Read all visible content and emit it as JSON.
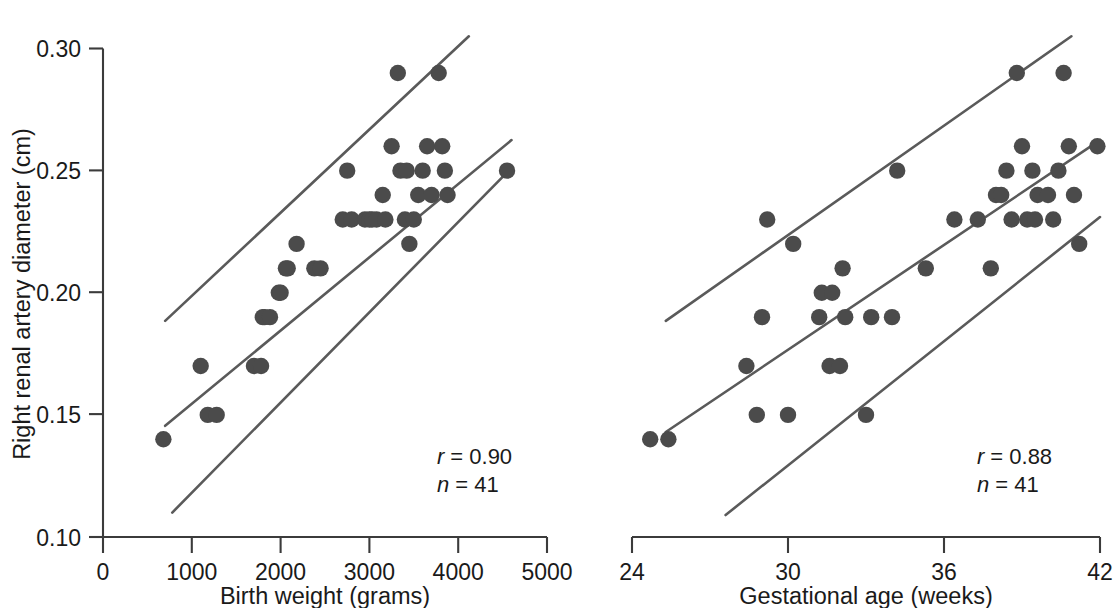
{
  "figure": {
    "background": "#ffffff",
    "point_color": "#4b4b4b",
    "line_color": "#5a5a5a",
    "axis_color": "#3b3b3b",
    "shared_ylabel": "Right renal artery diameter (cm)",
    "ytick_labels": [
      "0.10",
      "0.15",
      "0.20",
      "0.25",
      "0.30"
    ],
    "left_xtick_labels": [
      "0",
      "1000",
      "2000",
      "3000",
      "4000",
      "5000"
    ],
    "right_xtick_labels": [
      "24",
      "30",
      "36",
      "42"
    ],
    "left_xlabel": "Birth weight (grams)",
    "right_xlabel": "Gestational age (weeks)",
    "left_r_label": "r",
    "left_r_eq": "= 0.90",
    "left_n_label": "n",
    "left_n_eq": "= 41",
    "right_r_label": "r",
    "right_r_eq": "= 0.88",
    "right_n_label": "n",
    "right_n_eq": "= 41"
  },
  "chart_data": [
    {
      "type": "scatter",
      "panel": "left",
      "title": "",
      "xlabel": "Birth weight (grams)",
      "ylabel": "Right renal artery diameter (cm)",
      "xlim": [
        0,
        5000
      ],
      "ylim": [
        0.1,
        0.3
      ],
      "xticks": [
        0,
        1000,
        2000,
        3000,
        4000,
        5000
      ],
      "yticks": [
        0.1,
        0.15,
        0.2,
        0.25,
        0.3
      ],
      "grid": false,
      "legend": "none",
      "annotations": [
        "r = 0.90",
        "n = 41"
      ],
      "correlation_r": 0.9,
      "n": 41,
      "x": [
        680,
        1100,
        1180,
        1280,
        1700,
        1780,
        1800,
        1820,
        1880,
        1980,
        2000,
        2060,
        2080,
        2180,
        2380,
        2450,
        2700,
        2800,
        2950,
        3000,
        3030,
        3080,
        3150,
        3180,
        3250,
        3320,
        3350,
        3400,
        3420,
        3450,
        3500,
        3550,
        3600,
        3650,
        3700,
        3780,
        3820,
        3850,
        3880,
        4550,
        2750
      ],
      "y": [
        0.14,
        0.17,
        0.15,
        0.15,
        0.17,
        0.17,
        0.19,
        0.19,
        0.19,
        0.2,
        0.2,
        0.21,
        0.21,
        0.22,
        0.21,
        0.21,
        0.23,
        0.23,
        0.23,
        0.23,
        0.23,
        0.23,
        0.24,
        0.23,
        0.26,
        0.29,
        0.25,
        0.23,
        0.25,
        0.22,
        0.23,
        0.24,
        0.25,
        0.26,
        0.24,
        0.29,
        0.26,
        0.25,
        0.24,
        0.25,
        0.25
      ],
      "series": [
        {
          "name": "regression line",
          "kind": "line",
          "x": [
            700,
            4600
          ],
          "y": [
            0.1455,
            0.2625
          ]
        },
        {
          "name": "upper 95% prediction band",
          "kind": "line",
          "x": [
            700,
            4120
          ],
          "y": [
            0.1885,
            0.305
          ]
        },
        {
          "name": "lower 95% prediction band",
          "kind": "line",
          "x": [
            780,
            4570
          ],
          "y": [
            0.11,
            0.25
          ]
        }
      ]
    },
    {
      "type": "scatter",
      "panel": "right",
      "title": "",
      "xlabel": "Gestational age (weeks)",
      "ylabel": "Right renal artery diameter (cm)",
      "xlim": [
        24,
        42
      ],
      "ylim": [
        0.1,
        0.3
      ],
      "xticks": [
        24,
        30,
        36,
        42
      ],
      "yticks": [
        0.1,
        0.15,
        0.2,
        0.25,
        0.3
      ],
      "grid": false,
      "legend": "none",
      "annotations": [
        "r = 0.88",
        "n = 41"
      ],
      "correlation_r": 0.88,
      "n": 41,
      "x": [
        24.7,
        25.4,
        28.4,
        28.8,
        29.0,
        29.2,
        30.0,
        30.2,
        31.2,
        31.3,
        31.6,
        31.7,
        32.0,
        32.1,
        32.2,
        33.0,
        33.2,
        34.0,
        34.2,
        35.3,
        36.4,
        37.3,
        37.8,
        38.0,
        38.2,
        38.4,
        38.6,
        38.8,
        39.0,
        39.2,
        39.4,
        39.5,
        39.6,
        40.0,
        40.2,
        40.4,
        40.6,
        40.8,
        41.0,
        41.2,
        41.9
      ],
      "y": [
        0.14,
        0.14,
        0.17,
        0.15,
        0.19,
        0.23,
        0.15,
        0.22,
        0.19,
        0.2,
        0.17,
        0.2,
        0.17,
        0.21,
        0.19,
        0.15,
        0.19,
        0.19,
        0.25,
        0.21,
        0.23,
        0.23,
        0.21,
        0.24,
        0.24,
        0.25,
        0.23,
        0.29,
        0.26,
        0.23,
        0.25,
        0.23,
        0.24,
        0.24,
        0.23,
        0.25,
        0.29,
        0.26,
        0.24,
        0.22,
        0.26
      ],
      "series": [
        {
          "name": "regression line",
          "kind": "line",
          "x": [
            25.3,
            42.0
          ],
          "y": [
            0.143,
            0.2625
          ]
        },
        {
          "name": "upper 95% prediction band",
          "kind": "line",
          "x": [
            25.3,
            40.9
          ],
          "y": [
            0.1885,
            0.305
          ]
        },
        {
          "name": "lower 95% prediction band",
          "kind": "line",
          "x": [
            27.6,
            42.0
          ],
          "y": [
            0.109,
            0.231
          ]
        }
      ]
    }
  ]
}
